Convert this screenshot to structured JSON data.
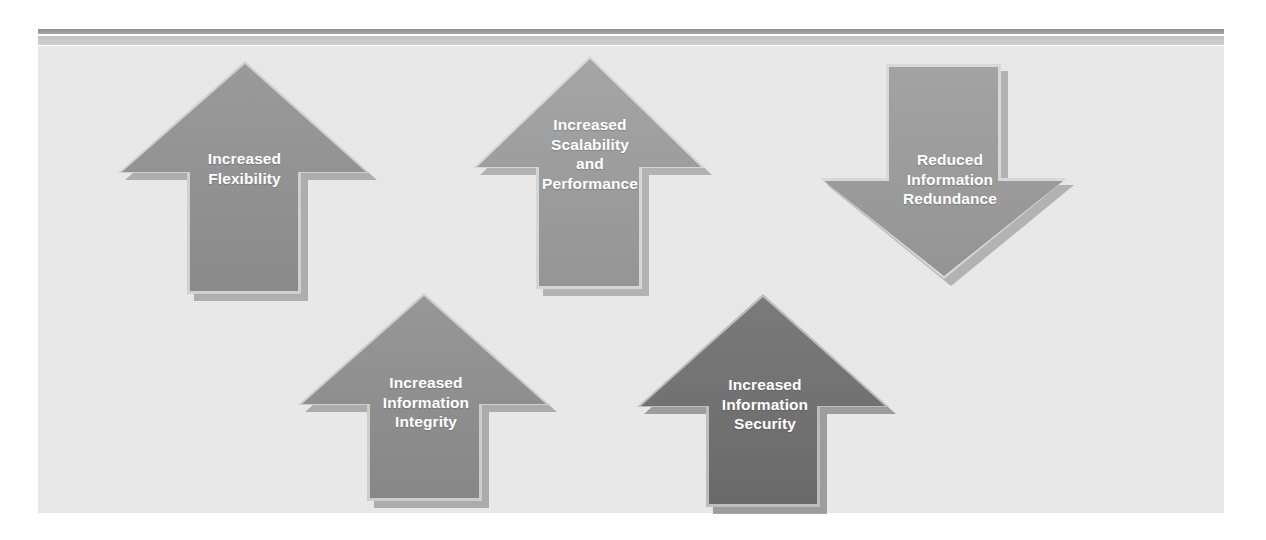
{
  "figure": {
    "background_color": "#e9e9e9",
    "page_color": "#ffffff"
  },
  "rules": {
    "dark_color": "#9d9d9d",
    "light_color": "#c8c8c8"
  },
  "arrows": [
    {
      "id": "increased-flexibility",
      "label": "Increased\nFlexibility",
      "direction": "up",
      "fill_color": "#8e8e8e",
      "highlight_color": "#c9c9c9",
      "shadow_color": "#7a7a7a",
      "text_color": "#ffffff"
    },
    {
      "id": "increased-scalability-and-performance",
      "label": "Increased\nScalability\nand\nPerformance",
      "direction": "up",
      "fill_color": "#9b9b9b",
      "highlight_color": "#d2d2d2",
      "shadow_color": "#868686",
      "text_color": "#ffffff"
    },
    {
      "id": "reduced-information-redundance",
      "label": "Reduced\nInformation\nRedundance",
      "direction": "down",
      "fill_color": "#9b9b9b",
      "highlight_color": "#d4d4d4",
      "shadow_color": "#868686",
      "text_color": "#ffffff"
    },
    {
      "id": "increased-information-integrity",
      "label": "Increased\nInformation\nIntegrity",
      "direction": "up",
      "fill_color": "#8b8b8b",
      "highlight_color": "#c9c9c9",
      "shadow_color": "#777777",
      "text_color": "#ffffff"
    },
    {
      "id": "increased-information-security",
      "label": "Increased\nInformation\nSecurity",
      "direction": "up",
      "fill_color": "#6f6f6f",
      "highlight_color": "#b4b4b4",
      "shadow_color": "#5a5a5a",
      "text_color": "#ffffff"
    }
  ]
}
